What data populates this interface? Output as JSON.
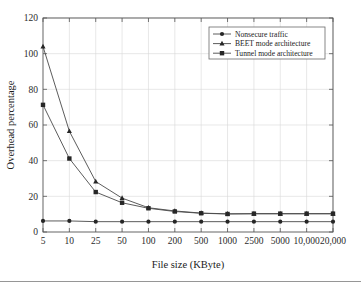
{
  "chart_data": {
    "type": "line",
    "title": "",
    "subtitle": "",
    "xlabel": "File size (KByte)",
    "ylabel": "Overhead percentage",
    "categories": [
      "5",
      "10",
      "25",
      "50",
      "100",
      "200",
      "500",
      "1000",
      "2500",
      "5000",
      "10,000",
      "20,000"
    ],
    "ylim": [
      0,
      120
    ],
    "yticks": [
      "0",
      "20",
      "40",
      "60",
      "80",
      "100",
      "120"
    ],
    "ytick_values": [
      0,
      20,
      40,
      60,
      80,
      100,
      120
    ],
    "grid": true,
    "legend_position": "top-right",
    "series": [
      {
        "name": "Nonsecure traffic",
        "marker": "circle",
        "color": "#262626",
        "values": [
          6.2,
          6.2,
          5.8,
          5.8,
          5.8,
          5.8,
          5.8,
          5.8,
          5.8,
          5.8,
          5.8,
          5.8
        ]
      },
      {
        "name": "BEET mode architecture",
        "marker": "triangle",
        "color": "#262626",
        "values": [
          104.0,
          56.5,
          28.3,
          19.0,
          13.6,
          11.8,
          10.6,
          10.2,
          10.2,
          10.2,
          10.2,
          10.2
        ]
      },
      {
        "name": "Tunnel mode architecture",
        "marker": "square",
        "color": "#262626",
        "values": [
          71.3,
          41.2,
          22.4,
          16.4,
          13.3,
          11.5,
          10.5,
          10.1,
          10.3,
          10.3,
          10.3,
          10.3
        ]
      }
    ]
  },
  "legend": {
    "entries": [
      {
        "label": "Nonsecure traffic",
        "marker": "circle-marker-icon"
      },
      {
        "label": "BEET mode architecture",
        "marker": "triangle-marker-icon"
      },
      {
        "label": "Tunnel mode architecture",
        "marker": "square-marker-icon"
      }
    ]
  },
  "colors": {
    "line": "#4a4a4a",
    "marker": "#262626",
    "grid": "#d8d8d8",
    "axis": "#555555",
    "background": "#ffffff"
  }
}
